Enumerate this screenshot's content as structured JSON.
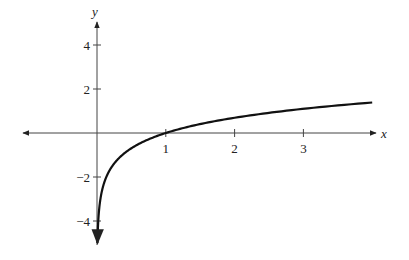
{
  "chart_data": {
    "type": "line",
    "title": "",
    "function": "y = ln(x)",
    "xlabel": "x",
    "ylabel": "y",
    "xlim": [
      -1.1,
      4.2
    ],
    "ylim": [
      -5,
      5
    ],
    "grid": false,
    "legend": null,
    "x_ticks": [
      1,
      2,
      3
    ],
    "x_tick_labels": [
      "1",
      "2",
      "3"
    ],
    "y_ticks": [
      4,
      2,
      -2,
      -4
    ],
    "y_tick_labels": [
      "4",
      "2",
      "−2",
      "−4"
    ],
    "series": [
      {
        "name": "ln x",
        "x": [
          0.0067,
          0.01,
          0.02,
          0.05,
          0.1,
          0.2,
          0.3,
          0.5,
          0.75,
          1,
          1.5,
          2,
          2.5,
          3,
          3.5,
          4
        ],
        "y": [
          -5.0,
          -4.61,
          -3.91,
          -3.0,
          -2.3,
          -1.61,
          -1.2,
          -0.69,
          -0.29,
          0,
          0.41,
          0.69,
          0.92,
          1.1,
          1.25,
          1.39
        ]
      }
    ],
    "annotations": [
      "vertical asymptote at x = 0 (curve arrow pointing down)"
    ]
  }
}
